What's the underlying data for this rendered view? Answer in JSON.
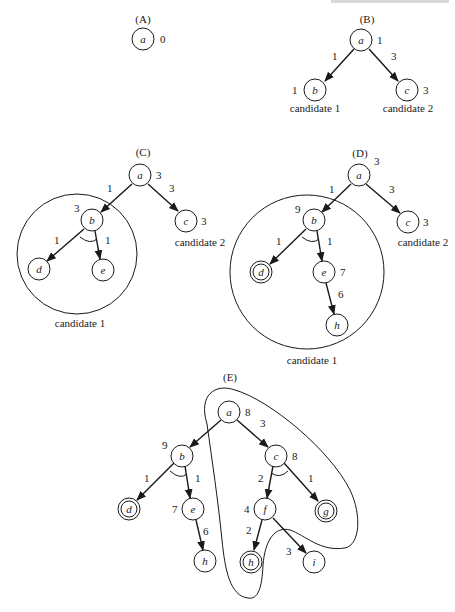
{
  "figure": {
    "panels": [
      {
        "id": "A",
        "label": "(A)",
        "nodes": [
          {
            "name": "a",
            "label": "a",
            "cost": "0",
            "goal": false
          }
        ],
        "edges": [],
        "candidates": []
      },
      {
        "id": "B",
        "label": "(B)",
        "nodes": [
          {
            "name": "a",
            "label": "a",
            "cost": "1",
            "goal": false
          },
          {
            "name": "b",
            "label": "b",
            "cost": "1",
            "goal": false
          },
          {
            "name": "c",
            "label": "c",
            "cost": "3",
            "goal": false
          }
        ],
        "edges": [
          {
            "from": "a",
            "to": "b",
            "weight": "1"
          },
          {
            "from": "a",
            "to": "c",
            "weight": "3"
          }
        ],
        "candidates": [
          "candidate 1",
          "candidate 2"
        ]
      },
      {
        "id": "C",
        "label": "(C)",
        "nodes": [
          {
            "name": "a",
            "label": "a",
            "cost": "3",
            "goal": false
          },
          {
            "name": "b",
            "label": "b",
            "cost": "3",
            "goal": false
          },
          {
            "name": "c",
            "label": "c",
            "cost": "3",
            "goal": false
          },
          {
            "name": "d",
            "label": "d",
            "cost": "",
            "goal": false
          },
          {
            "name": "e",
            "label": "e",
            "cost": "",
            "goal": false
          }
        ],
        "edges": [
          {
            "from": "a",
            "to": "b",
            "weight": "1"
          },
          {
            "from": "a",
            "to": "c",
            "weight": "3"
          },
          {
            "from": "b",
            "to": "d",
            "weight": "1",
            "and_arc": true
          },
          {
            "from": "b",
            "to": "e",
            "weight": "1",
            "and_arc": true
          }
        ],
        "candidates": [
          "candidate 1",
          "candidate 2"
        ]
      },
      {
        "id": "D",
        "label": "(D)",
        "nodes": [
          {
            "name": "a",
            "label": "a",
            "cost": "3",
            "goal": false
          },
          {
            "name": "b",
            "label": "b",
            "cost": "9",
            "goal": false
          },
          {
            "name": "c",
            "label": "c",
            "cost": "3",
            "goal": false
          },
          {
            "name": "d",
            "label": "d",
            "cost": "",
            "goal": true
          },
          {
            "name": "e",
            "label": "e",
            "cost": "7",
            "goal": false
          },
          {
            "name": "h",
            "label": "h",
            "cost": "",
            "goal": false
          }
        ],
        "edges": [
          {
            "from": "a",
            "to": "b",
            "weight": "1"
          },
          {
            "from": "a",
            "to": "c",
            "weight": "3"
          },
          {
            "from": "b",
            "to": "d",
            "weight": "1",
            "and_arc": true
          },
          {
            "from": "b",
            "to": "e",
            "weight": "1",
            "and_arc": true
          },
          {
            "from": "e",
            "to": "h",
            "weight": "6"
          }
        ],
        "candidates": [
          "candidate 1",
          "candidate 2"
        ]
      },
      {
        "id": "E",
        "label": "(E)",
        "nodes": [
          {
            "name": "a",
            "label": "a",
            "cost": "8",
            "goal": false
          },
          {
            "name": "b",
            "label": "b",
            "cost": "9",
            "goal": false
          },
          {
            "name": "c",
            "label": "c",
            "cost": "8",
            "goal": false
          },
          {
            "name": "d",
            "label": "d",
            "cost": "",
            "goal": true
          },
          {
            "name": "e",
            "label": "e",
            "cost": "7",
            "goal": false
          },
          {
            "name": "h1",
            "label": "h",
            "cost": "",
            "goal": false
          },
          {
            "name": "f",
            "label": "f",
            "cost": "4",
            "goal": false
          },
          {
            "name": "g",
            "label": "g",
            "cost": "",
            "goal": true
          },
          {
            "name": "h2",
            "label": "h",
            "cost": "",
            "goal": true
          },
          {
            "name": "i",
            "label": "i",
            "cost": "",
            "goal": false
          }
        ],
        "edges": [
          {
            "from": "a",
            "to": "b",
            "weight": ""
          },
          {
            "from": "a",
            "to": "c",
            "weight": "3"
          },
          {
            "from": "b",
            "to": "d",
            "weight": "1",
            "and_arc": true
          },
          {
            "from": "b",
            "to": "e",
            "weight": "1",
            "and_arc": true
          },
          {
            "from": "e",
            "to": "h1",
            "weight": "6"
          },
          {
            "from": "c",
            "to": "f",
            "weight": "2",
            "and_arc": true
          },
          {
            "from": "c",
            "to": "g",
            "weight": "1",
            "and_arc": true
          },
          {
            "from": "f",
            "to": "h2",
            "weight": "2"
          },
          {
            "from": "f",
            "to": "i",
            "weight": "3"
          }
        ],
        "candidates": []
      }
    ]
  }
}
